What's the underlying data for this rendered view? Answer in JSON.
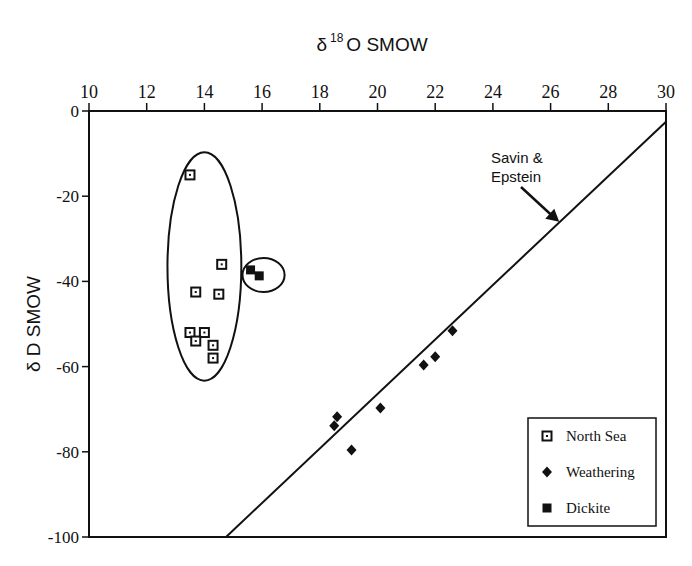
{
  "chart_data": {
    "type": "scatter",
    "title": "",
    "xlabel": "δ 18O SMOW",
    "xlabel_parts": {
      "delta": "δ",
      "sup": "18",
      "main": "O  SMOW"
    },
    "ylabel": "δ D SMOW",
    "xlim": [
      10,
      30
    ],
    "ylim": [
      -100,
      0
    ],
    "x_ticks": [
      10,
      12,
      14,
      16,
      18,
      20,
      22,
      24,
      26,
      28,
      30
    ],
    "x_tick_labels": [
      "10",
      "12",
      "14",
      "16",
      "18",
      "20",
      "22",
      "24",
      "26",
      "28",
      "30"
    ],
    "y_ticks": [
      0,
      -20,
      -40,
      -60,
      -80,
      -100
    ],
    "y_tick_labels": [
      "0",
      "-20",
      "-40",
      "-60",
      "-80",
      "-100"
    ],
    "x_axis_position": "top",
    "grid": false,
    "legend_position": "bottom-right",
    "series": [
      {
        "name": "North Sea",
        "marker": "open-square",
        "points": [
          [
            13.5,
            -15
          ],
          [
            14.6,
            -36
          ],
          [
            13.7,
            -42.5
          ],
          [
            14.5,
            -43
          ],
          [
            13.5,
            -52
          ],
          [
            14.0,
            -52
          ],
          [
            13.7,
            -54
          ],
          [
            14.3,
            -55
          ],
          [
            14.3,
            -58
          ]
        ]
      },
      {
        "name": "Weathering",
        "marker": "filled-diamond",
        "points": [
          [
            22.6,
            -51.6
          ],
          [
            22.0,
            -57.7
          ],
          [
            21.6,
            -59.6
          ],
          [
            20.1,
            -69.7
          ],
          [
            18.6,
            -71.8
          ],
          [
            18.5,
            -73.9
          ],
          [
            19.1,
            -79.6
          ]
        ]
      },
      {
        "name": "Dickite",
        "marker": "filled-square",
        "points": [
          [
            15.6,
            -37.3
          ],
          [
            15.9,
            -38.7
          ]
        ]
      }
    ],
    "reference_line": {
      "name": "Savin & Epstein",
      "label_lines": [
        "Savin &",
        "Epstein"
      ],
      "from": [
        14.75,
        -100
      ],
      "to": [
        30,
        -2.5
      ],
      "arrow_target": [
        26.3,
        -26
      ]
    },
    "ellipses": [
      {
        "name": "north-sea-cluster",
        "center": [
          14.0,
          -36.5
        ],
        "x_radius": 1.28,
        "y_radius": 26.8
      },
      {
        "name": "dickite-cluster",
        "center": [
          16.05,
          -38.5
        ],
        "x_radius": 0.73,
        "y_radius": 4.0
      }
    ]
  }
}
